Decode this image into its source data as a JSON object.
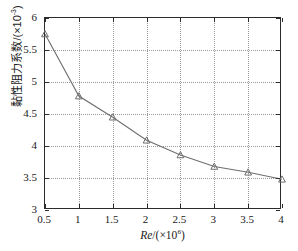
{
  "chart_data": {
    "type": "line",
    "title": "",
    "subtitle": "",
    "xlabel": "Re/(×10⁶)",
    "ylabel": "黏性阻力系数/(×10⁻³)",
    "x": [
      0.5,
      1,
      1.5,
      2,
      2.5,
      3,
      3.5,
      4
    ],
    "values": [
      5.75,
      4.78,
      4.45,
      4.09,
      3.86,
      3.68,
      3.59,
      3.48
    ],
    "series": [
      {
        "name": "viscous-resistance-coefficient",
        "values": [
          5.75,
          4.78,
          4.45,
          4.09,
          3.86,
          3.68,
          3.59,
          3.48
        ]
      }
    ],
    "xlim": [
      0.5,
      4
    ],
    "ylim": [
      3,
      6
    ],
    "xticks": [
      "0.5",
      "1",
      "1.5",
      "2",
      "2.5",
      "3",
      "3.5",
      "4"
    ],
    "xtick_values": [
      0.5,
      1,
      1.5,
      2,
      2.5,
      3,
      3.5,
      4
    ],
    "yticks": [
      "3",
      "3.5",
      "4",
      "4.5",
      "5",
      "5.5",
      "6"
    ],
    "ytick_values": [
      3,
      3.5,
      4,
      4.5,
      5,
      5.5,
      6
    ],
    "grid": true,
    "legend": false,
    "marker": "triangle",
    "line_color": "#6e6e6e",
    "marker_color": "#6e6e6e",
    "grid_color": "#9a9a9a",
    "axis_color": "#2b2b2b",
    "background": "#ffffff"
  },
  "axis_titles": {
    "x_symbol": "Re",
    "x_unit_prefix": "/(×10",
    "x_unit_exp": "6",
    "x_unit_suffix": ")",
    "y_full": "黏性阻力系数/(×10",
    "y_exp": "-3",
    "y_suffix": ")"
  }
}
